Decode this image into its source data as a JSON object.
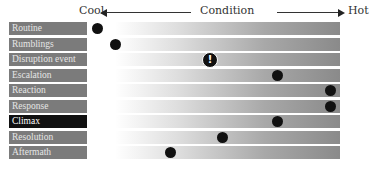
{
  "header": {
    "cool_label": "Cool",
    "condition_label": "Condition",
    "hot_label": "Hot"
  },
  "rows": [
    {
      "label": "Routine",
      "position": 97,
      "marker": "dot"
    },
    {
      "label": "Rumblings",
      "position": 115,
      "marker": "dot"
    },
    {
      "label": "Disruption event",
      "position": 210,
      "marker": "alert"
    },
    {
      "label": "Escalation",
      "position": 277,
      "marker": "dot"
    },
    {
      "label": "Reaction",
      "position": 330,
      "marker": "dot"
    },
    {
      "label": "Response",
      "position": 330,
      "marker": "dot"
    },
    {
      "label": "Climax",
      "position": 277,
      "marker": "dot",
      "highlight": true
    },
    {
      "label": "Resolution",
      "position": 222,
      "marker": "dot"
    },
    {
      "label": "Aftermath",
      "position": 170,
      "marker": "dot"
    }
  ],
  "alert_glyph": "!",
  "colors": {
    "label_bg": "#7b7b7b",
    "highlight_bg": "#111111",
    "bar_end": "#8a8a8a",
    "marker": "#111111"
  }
}
